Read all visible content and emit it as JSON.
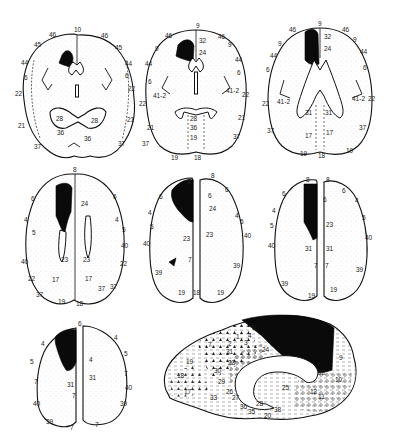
{
  "figure": {
    "lesion_color": "#000000",
    "background_color": "#ffffff"
  },
  "slices": [
    {
      "id": "slice-1",
      "labels": [
        "10",
        "46",
        "46",
        "45",
        "45",
        "44",
        "44",
        "6",
        "6",
        "22",
        "22",
        "21",
        "21",
        "37",
        "37",
        "28",
        "28",
        "36",
        "36"
      ]
    },
    {
      "id": "slice-2",
      "labels": [
        "9",
        "46",
        "46",
        "9",
        "9",
        "32",
        "24",
        "44",
        "44",
        "6",
        "6",
        "41-2",
        "41-2",
        "22",
        "22",
        "21",
        "21",
        "37",
        "37",
        "28",
        "36",
        "19",
        "18",
        "19"
      ]
    },
    {
      "id": "slice-3",
      "labels": [
        "9",
        "46",
        "46",
        "9",
        "9",
        "32",
        "24",
        "44",
        "44",
        "6",
        "6",
        "41-2",
        "41-2",
        "22",
        "22",
        "37",
        "37",
        "31",
        "31",
        "17",
        "17",
        "19",
        "18",
        "19"
      ]
    },
    {
      "id": "slice-4",
      "labels": [
        "8",
        "6",
        "6",
        "24",
        "4",
        "4",
        "5",
        "5",
        "40",
        "40",
        "22",
        "22",
        "23",
        "23",
        "37",
        "37",
        "17",
        "17",
        "37",
        "19",
        "18"
      ]
    },
    {
      "id": "slice-5",
      "labels": [
        "8",
        "8",
        "6",
        "6",
        "6",
        "24",
        "4",
        "4",
        "5",
        "5",
        "40",
        "40",
        "23",
        "23",
        "7",
        "39",
        "39",
        "19",
        "18",
        "19"
      ]
    },
    {
      "id": "slice-6",
      "labels": [
        "8",
        "8",
        "6",
        "6",
        "6",
        "4",
        "4",
        "5",
        "5",
        "40",
        "40",
        "23",
        "31",
        "31",
        "7",
        "7",
        "39",
        "39",
        "19",
        "19"
      ]
    },
    {
      "id": "slice-7",
      "labels": [
        "6",
        "4",
        "4",
        "5",
        "5",
        "4",
        "31",
        "31",
        "7",
        "7",
        "7",
        "40",
        "40",
        "39",
        "39",
        "7",
        "7"
      ]
    }
  ],
  "sagittal": {
    "id": "medial-view",
    "labels": [
      "6",
      "4",
      "3",
      "1",
      "2",
      "7",
      "31",
      "23",
      "24",
      "32",
      "9",
      "10",
      "19",
      "18",
      "17",
      "30",
      "29",
      "26",
      "27",
      "28",
      "25",
      "11",
      "12",
      "38",
      "36",
      "35",
      "20",
      "33"
    ]
  }
}
